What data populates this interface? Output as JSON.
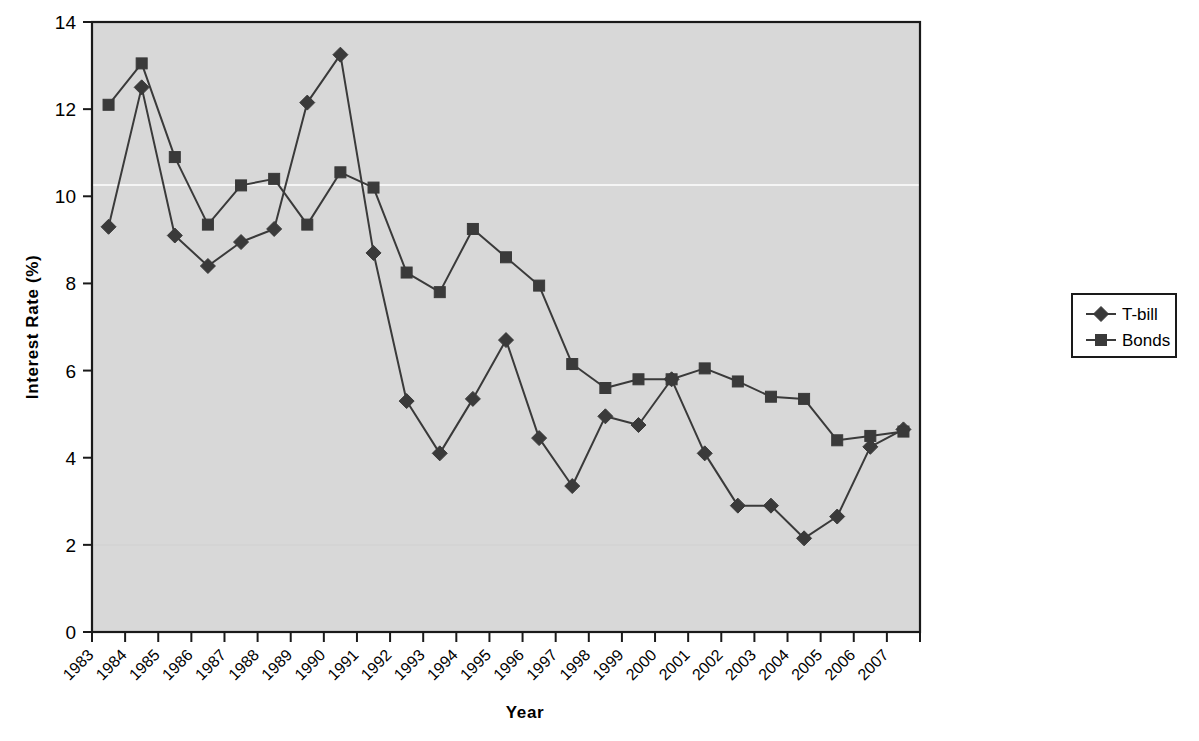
{
  "chart_data": {
    "type": "line",
    "title": "",
    "xlabel": "Year",
    "ylabel": "Interest Rate (%)",
    "categories": [
      "1983",
      "1984",
      "1985",
      "1986",
      "1987",
      "1988",
      "1989",
      "1990",
      "1991",
      "1992",
      "1993",
      "1994",
      "1995",
      "1996",
      "1997",
      "1998",
      "1999",
      "2000",
      "2001",
      "2002",
      "2003",
      "2004",
      "2005",
      "2006",
      "2007"
    ],
    "x": [
      1983,
      1984,
      1985,
      1986,
      1987,
      1988,
      1989,
      1990,
      1991,
      1992,
      1993,
      1994,
      1995,
      1996,
      1997,
      1998,
      1999,
      2000,
      2001,
      2002,
      2003,
      2004,
      2005,
      2006,
      2007
    ],
    "series": [
      {
        "name": "T-bill",
        "marker": "diamond",
        "values": [
          9.3,
          12.5,
          9.1,
          8.4,
          8.95,
          9.25,
          12.15,
          13.25,
          8.7,
          5.3,
          4.1,
          5.35,
          6.7,
          4.45,
          3.35,
          4.95,
          4.75,
          5.8,
          4.1,
          2.9,
          2.9,
          2.15,
          2.65,
          4.25,
          4.65
        ]
      },
      {
        "name": "Bonds",
        "marker": "square",
        "values": [
          12.1,
          13.05,
          10.9,
          9.35,
          10.25,
          10.4,
          9.35,
          10.55,
          10.2,
          8.25,
          7.8,
          9.25,
          8.6,
          7.95,
          6.15,
          5.6,
          5.8,
          5.8,
          6.05,
          5.75,
          5.4,
          5.35,
          4.4,
          4.5,
          4.6
        ]
      }
    ],
    "ylim": [
      0,
      14
    ],
    "yticks": [
      0,
      2,
      4,
      6,
      8,
      10,
      12,
      14
    ],
    "ytick_labels": [
      "0",
      "2",
      "4",
      "6",
      "8",
      "10",
      "12",
      "14"
    ],
    "grid": false,
    "legend_position": "right",
    "plot_background_color": "#d8d8d8",
    "series_color": "#3a3a3a",
    "axis_color": "#000000"
  },
  "legend": {
    "entries": [
      {
        "label": "T-bill",
        "marker_name": "diamond-marker"
      },
      {
        "label": "Bonds",
        "marker_name": "square-marker"
      }
    ]
  },
  "axes": {
    "y_title": "Interest Rate (%)",
    "x_title": "Year"
  }
}
